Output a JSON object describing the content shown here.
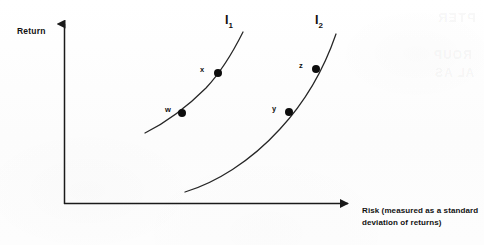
{
  "figure": {
    "background_color": "#fdfdfd",
    "ink_color": "#111111",
    "axis_color": "#1a1a1a"
  },
  "axes": {
    "y_title": "Return",
    "x_title": "Risk (measured as a standard deviation of returns)",
    "x_title_line_1": "Risk (measured as a standard",
    "x_title_line_2": "deviation of returns)",
    "origin": {
      "x": 64,
      "y": 204
    },
    "y_axis_top": {
      "x": 64,
      "y": 15
    },
    "x_axis_right": {
      "x": 357,
      "y": 204
    }
  },
  "curves": [
    {
      "id": "I1",
      "label": "I",
      "subscript": "1",
      "label_position": {
        "x": 225,
        "y": 13
      },
      "path": "M145,133 C163,124 186,108 206,88 C222,71 234,50 243,32",
      "points": [
        {
          "id": "W",
          "label": "w",
          "x": 182,
          "y": 113,
          "label_x": 165,
          "label_y": 105
        },
        {
          "id": "X",
          "label": "x",
          "x": 218,
          "y": 73,
          "label_x": 200,
          "label_y": 65
        }
      ]
    },
    {
      "id": "I2",
      "label": "I",
      "subscript": "2",
      "label_position": {
        "x": 315,
        "y": 13
      },
      "path": "M185,192 C215,183 250,162 280,129 C306,101 325,66 336,34",
      "points": [
        {
          "id": "Y",
          "label": "y",
          "x": 289,
          "y": 112,
          "label_x": 272,
          "label_y": 104
        },
        {
          "id": "Z",
          "label": "z",
          "x": 316,
          "y": 69,
          "label_x": 299,
          "label_y": 61
        }
      ]
    }
  ],
  "chart_data": {
    "type": "line",
    "title": "",
    "xlabel": "Risk (measured as a standard deviation of returns)",
    "ylabel": "Return",
    "grid": false,
    "legend": "none",
    "axis_arrows": true,
    "series": [
      {
        "name": "I1",
        "labeled_points": [
          {
            "label": "w",
            "x": 182,
            "y": 113
          },
          {
            "label": "x",
            "x": 218,
            "y": 73
          }
        ]
      },
      {
        "name": "I2",
        "labeled_points": [
          {
            "label": "y",
            "x": 289,
            "y": 112
          },
          {
            "label": "z",
            "x": 316,
            "y": 69
          }
        ]
      }
    ]
  },
  "ghost_text": {
    "line_1": "PTER",
    "line_2": "ROUP",
    "line_3": "AL AS"
  }
}
